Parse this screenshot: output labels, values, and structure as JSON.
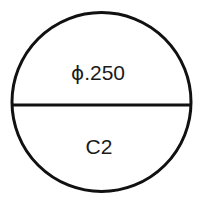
{
  "drawing": {
    "title": "Circular part section view",
    "background_color": "#ffffff",
    "line_color": "#111111",
    "text_color": "#1a1a1a",
    "stroke_width": 3,
    "circle": {
      "name": "outer-circle",
      "center_x": 101.5,
      "center_y": 102,
      "radius": 89.5
    },
    "chord": {
      "name": "horizontal-chord",
      "x1": 12,
      "y1": 105,
      "x2": 191,
      "y2": 105
    },
    "labels": {
      "diameter": {
        "symbol": "ϕ",
        "value": ".250",
        "full_text": "ϕ.250",
        "x": 98,
        "y": 72
      },
      "callout": {
        "text": "C2",
        "x": 99,
        "y": 146
      }
    }
  }
}
